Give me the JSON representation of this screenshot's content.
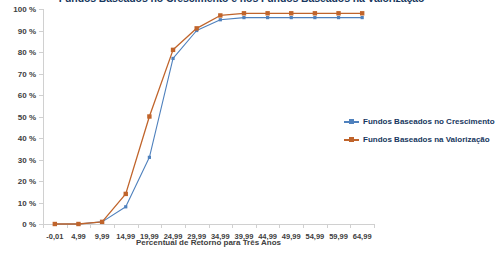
{
  "chart_data": {
    "type": "line",
    "title": "Fundos Baseados no Crescimento e nos Fundos Baseados na Valorização",
    "xlabel": "Percentual de Retorno para Três Anos",
    "ylabel": "",
    "categories": [
      "-0,01",
      "4,99",
      "9,99",
      "14,99",
      "19,99",
      "24,99",
      "29,99",
      "34,99",
      "39,99",
      "44,99",
      "49,99",
      "54,99",
      "59,99",
      "64,99"
    ],
    "ytick_labels": [
      "0 %",
      "10 %",
      "20 %",
      "30 %",
      "40 %",
      "50 %",
      "60 %",
      "70 %",
      "80 %",
      "90 %",
      "100 %"
    ],
    "ytick_values": [
      0,
      10,
      20,
      30,
      40,
      50,
      60,
      70,
      80,
      90,
      100
    ],
    "ylim": [
      0,
      100
    ],
    "grid": false,
    "legend_position": "right-middle",
    "series": [
      {
        "name": "Fundos Baseados no Crescimento",
        "color": "#4F81BD",
        "marker": "square",
        "values": [
          0,
          0,
          1,
          8,
          31,
          77,
          90,
          95,
          96,
          96,
          96,
          96,
          96,
          96
        ]
      },
      {
        "name": "Fundos Baseados na Valorização",
        "color": "#C0642B",
        "marker": "square",
        "values": [
          0,
          0,
          1,
          14,
          50,
          81,
          91,
          97,
          98,
          98,
          98,
          98,
          98,
          98
        ]
      }
    ]
  },
  "legend": {
    "items": [
      {
        "label": "Fundos Baseados no Crescimento",
        "color": "#4F81BD"
      },
      {
        "label": "Fundos Baseados na Valorização",
        "color": "#C0642B"
      }
    ]
  }
}
